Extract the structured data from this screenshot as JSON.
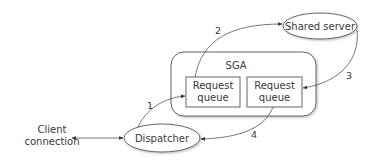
{
  "diagram": {
    "nodes": {
      "client": {
        "line1": "Client",
        "line2": "connection"
      },
      "dispatcher": {
        "label": "Dispatcher"
      },
      "sga": {
        "label": "SGA"
      },
      "queue_left": {
        "line1": "Request",
        "line2": "queue"
      },
      "queue_right": {
        "line1": "Request",
        "line2": "queue"
      },
      "shared_server": {
        "label": "Shared server"
      }
    },
    "edges": [
      {
        "label": "1",
        "from": "Dispatcher",
        "to": "Request queue (left)"
      },
      {
        "label": "2",
        "from": "Request queue (left)",
        "to": "Shared server"
      },
      {
        "label": "3",
        "from": "Shared server",
        "to": "Request queue (right)"
      },
      {
        "label": "4",
        "from": "Request queue (right)",
        "to": "Dispatcher"
      }
    ],
    "bidirectional": {
      "between": [
        "Client connection",
        "Dispatcher"
      ]
    },
    "colors": {
      "stroke": "#555555",
      "text": "#3a3a3a",
      "background": "#ffffff"
    }
  }
}
